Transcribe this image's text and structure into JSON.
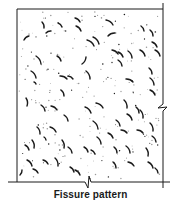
{
  "figure": {
    "caption": "Fissure pattern",
    "colors": {
      "ink": "#1a1a1a",
      "dots": "#9a9a9a",
      "background": "#ffffff"
    },
    "frame": {
      "top": {
        "x1": 17,
        "y1": 9,
        "x2": 163,
        "y2": 9
      },
      "left": {
        "x1": 17,
        "y1": 9,
        "x2": 17,
        "y2": 182
      },
      "right": {
        "x1": 163,
        "y1": 3,
        "x2": 163,
        "y2": 188
      },
      "bottom": {
        "x1": 8,
        "y1": 182,
        "x2": 170,
        "y2": 182
      }
    },
    "break_symbols": [
      {
        "name": "right-edge-break",
        "x": 163,
        "y": 108
      },
      {
        "name": "bottom-edge-break",
        "x": 88,
        "y": 182
      }
    ],
    "fissures": [
      [
        42,
        22,
        44,
        28
      ],
      [
        58,
        23,
        62,
        27
      ],
      [
        46,
        33,
        51,
        31
      ],
      [
        24,
        40,
        29,
        36
      ],
      [
        75,
        18,
        80,
        22
      ],
      [
        76,
        26,
        81,
        31
      ],
      [
        106,
        20,
        113,
        25
      ],
      [
        108,
        36,
        115,
        33
      ],
      [
        87,
        40,
        94,
        46
      ],
      [
        93,
        37,
        99,
        44
      ],
      [
        141,
        26,
        144,
        31
      ],
      [
        150,
        30,
        153,
        36
      ],
      [
        140,
        50,
        145,
        56
      ],
      [
        152,
        42,
        157,
        47
      ],
      [
        155,
        50,
        160,
        56
      ],
      [
        112,
        50,
        118,
        54
      ],
      [
        118,
        52,
        123,
        57
      ],
      [
        128,
        51,
        132,
        58
      ],
      [
        36,
        56,
        41,
        64
      ],
      [
        57,
        56,
        61,
        61
      ],
      [
        86,
        57,
        82,
        64
      ],
      [
        118,
        60,
        122,
        66
      ],
      [
        31,
        71,
        36,
        78
      ],
      [
        34,
        82,
        36,
        84
      ],
      [
        60,
        76,
        67,
        79
      ],
      [
        68,
        76,
        73,
        79
      ],
      [
        61,
        90,
        64,
        96
      ],
      [
        86,
        71,
        90,
        79
      ],
      [
        126,
        79,
        133,
        82
      ],
      [
        150,
        78,
        154,
        85
      ],
      [
        150,
        90,
        155,
        95
      ],
      [
        149,
        68,
        152,
        74
      ],
      [
        26,
        98,
        27,
        106
      ],
      [
        41,
        105,
        45,
        111
      ],
      [
        51,
        106,
        57,
        110
      ],
      [
        64,
        115,
        68,
        121
      ],
      [
        85,
        107,
        91,
        113
      ],
      [
        96,
        103,
        103,
        108
      ],
      [
        124,
        100,
        127,
        108
      ],
      [
        136,
        107,
        139,
        113
      ],
      [
        93,
        121,
        98,
        129
      ],
      [
        116,
        120,
        120,
        126
      ],
      [
        127,
        114,
        132,
        120
      ],
      [
        140,
        110,
        143,
        118
      ],
      [
        37,
        127,
        40,
        134
      ],
      [
        50,
        127,
        56,
        132
      ],
      [
        62,
        140,
        64,
        148
      ],
      [
        32,
        140,
        34,
        148
      ],
      [
        97,
        137,
        101,
        144
      ],
      [
        108,
        133,
        113,
        138
      ],
      [
        121,
        130,
        127,
        133
      ],
      [
        137,
        130,
        143,
        133
      ],
      [
        150,
        123,
        153,
        131
      ],
      [
        152,
        136,
        156,
        142
      ],
      [
        25,
        145,
        29,
        150
      ],
      [
        55,
        158,
        58,
        166
      ],
      [
        84,
        147,
        88,
        152
      ],
      [
        91,
        150,
        95,
        154
      ],
      [
        68,
        147,
        72,
        153
      ],
      [
        114,
        147,
        117,
        153
      ],
      [
        126,
        146,
        130,
        153
      ],
      [
        146,
        148,
        148,
        156
      ],
      [
        27,
        160,
        32,
        166
      ],
      [
        33,
        169,
        38,
        173
      ],
      [
        43,
        160,
        48,
        164
      ],
      [
        70,
        167,
        74,
        172
      ],
      [
        75,
        170,
        80,
        175
      ],
      [
        113,
        162,
        116,
        168
      ],
      [
        128,
        162,
        134,
        166
      ],
      [
        148,
        162,
        153,
        168
      ],
      [
        155,
        168,
        158,
        173
      ],
      [
        22,
        170,
        20,
        175
      ],
      [
        44,
        137,
        46,
        140
      ]
    ],
    "dot_count": 220
  }
}
